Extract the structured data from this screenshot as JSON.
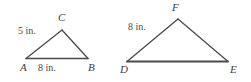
{
  "figure": {
    "background_color": "#ffffff",
    "stroke_color": "#4a4a4a",
    "label_color": "#3d3d3d",
    "triangles": [
      {
        "name": "triangle-abc",
        "vertices": [
          {
            "label": "A",
            "x": 26,
            "y": 58
          },
          {
            "label": "B",
            "x": 88,
            "y": 58
          },
          {
            "label": "C",
            "x": 62,
            "y": 30
          }
        ],
        "measures": [
          {
            "name": "side-ac-length",
            "text": "5 in."
          },
          {
            "name": "side-ab-length",
            "text": "8 in."
          }
        ]
      },
      {
        "name": "triangle-def",
        "vertices": [
          {
            "label": "D",
            "x": 127,
            "y": 61
          },
          {
            "label": "E",
            "x": 228,
            "y": 61
          },
          {
            "label": "F",
            "x": 178,
            "y": 19
          }
        ],
        "measures": [
          {
            "name": "side-df-length",
            "text": "8 in."
          }
        ]
      }
    ]
  }
}
